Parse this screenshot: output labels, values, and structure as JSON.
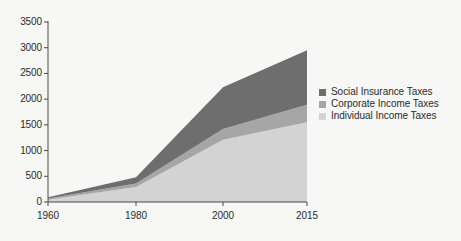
{
  "chart_data": {
    "type": "area",
    "title": "",
    "subtitle": "",
    "xlabel": "",
    "ylabel": "",
    "stacked": true,
    "grid": false,
    "legend_position": "right",
    "x": [
      1960,
      1980,
      2000,
      2015
    ],
    "xtick_labels": [
      "1960",
      "1980",
      "2000",
      "2015"
    ],
    "xlim": [
      1960,
      2015
    ],
    "ylim": [
      0,
      3500
    ],
    "ytick_labels": [
      "0",
      "500",
      "1000",
      "1500",
      "2000",
      "2500",
      "3000",
      "3500"
    ],
    "ytick_values": [
      0,
      500,
      1000,
      1500,
      2000,
      2500,
      3000,
      3500
    ],
    "series": [
      {
        "name": "Individual Income Taxes",
        "color": "#d3d3d3",
        "values": [
          45,
          290,
          1210,
          1550
        ]
      },
      {
        "name": "Corporate Income Taxes",
        "color": "#a6a6a6",
        "values": [
          25,
          70,
          210,
          340
        ]
      },
      {
        "name": "Social Insurance Taxes",
        "color": "#6e6e6e",
        "values": [
          20,
          120,
          810,
          1060
        ]
      }
    ],
    "legend_order": [
      "Social Insurance Taxes",
      "Corporate Income Taxes",
      "Individual Income Taxes"
    ],
    "colors": {
      "social_insurance": "#6e6e6e",
      "corporate_income": "#a6a6a6",
      "individual_income": "#d3d3d3",
      "axis": "#4a4a4a",
      "text": "#2b2b2b",
      "background": "#f7f7f5"
    }
  },
  "legend": {
    "items": [
      {
        "label": "Social Insurance Taxes",
        "color": "#6e6e6e"
      },
      {
        "label": "Corporate Income Taxes",
        "color": "#a6a6a6"
      },
      {
        "label": "Individual Income Taxes",
        "color": "#d3d3d3"
      }
    ]
  }
}
